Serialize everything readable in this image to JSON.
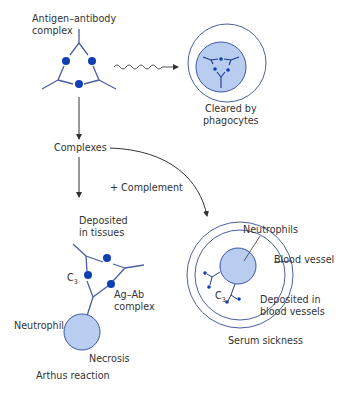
{
  "diagram": {
    "colors": {
      "line": "#4a5fa0",
      "dot": "#0f3fb0",
      "cell_fill": "#b9cdf0",
      "cell_stroke": "#3c58a6",
      "arrow": "#333333",
      "text": "#333333"
    },
    "labels": {
      "antigen_antibody_1": "Antigen–antibody",
      "antigen_antibody_2": "complex",
      "cleared_1": "Cleared by",
      "cleared_2": "phagocytes",
      "complexes": "Complexes",
      "complement": "+ Complement",
      "deposited_tissues_1": "Deposited",
      "deposited_tissues_2": "in tissues",
      "c3_left": "C",
      "c3_left_sub": "3",
      "agab_1": "Ag–Ab",
      "agab_2": "complex",
      "neutrophil": "Neutrophil",
      "necrosis": "Necrosis",
      "arthus": "Arthus reaction",
      "neutrophils": "Neutrophils",
      "blood_vessel": "Blood vessel",
      "c3_right": "C",
      "c3_right_sub": "3",
      "deposited_vessels_1": "Deposited in",
      "deposited_vessels_2": "blood vessels",
      "serum_sickness": "Serum sickness"
    }
  }
}
